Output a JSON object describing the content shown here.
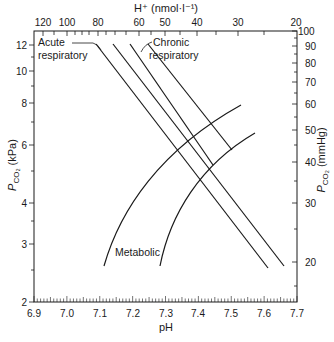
{
  "chart_data": {
    "type": "line",
    "title": "",
    "xlabel": "pH",
    "ylabel": "P_CO2 (kPa)",
    "ylabel_right": "P_CO2 (mmHg)",
    "xlabel_top": "H+ (nmol·l-1)",
    "xlim": [
      6.9,
      7.7
    ],
    "ylim": [
      2,
      13
    ],
    "yscale": "log",
    "grid": false,
    "x_ticks": [
      "6.9",
      "7.0",
      "7.1",
      "7.2",
      "7.3",
      "7.4",
      "7.5",
      "7.6",
      "7.7"
    ],
    "y_ticks_left": [
      "2",
      "3",
      "4",
      "6",
      "8",
      "10",
      "12"
    ],
    "y_ticks_right": [
      "20",
      "30",
      "40",
      "50",
      "60",
      "70",
      "80",
      "90",
      "100"
    ],
    "x_ticks_top": [
      "120",
      "100",
      "80",
      "60",
      "50",
      "40",
      "30",
      "20"
    ],
    "annotations": [
      "Acute respiratory",
      "Chronic respiratory",
      "Metabolic"
    ],
    "series": [
      {
        "name": "Acute respiratory (upper bound)",
        "x": [
          7.09,
          7.62
        ],
        "y": [
          11.9,
          2.7
        ]
      },
      {
        "name": "Acute respiratory (lower bound)",
        "x": [
          7.14,
          7.66
        ],
        "y": [
          11.9,
          2.7
        ]
      },
      {
        "name": "Chronic respiratory (upper bound)",
        "x": [
          7.19,
          7.44
        ],
        "y": [
          11.9,
          5.2
        ]
      },
      {
        "name": "Chronic respiratory (lower bound)",
        "x": [
          7.24,
          7.5
        ],
        "y": [
          11.9,
          5.9
        ]
      },
      {
        "name": "Metabolic (upper bound)",
        "x": [
          7.11,
          7.21,
          7.32,
          7.43,
          7.53
        ],
        "y": [
          2.7,
          3.7,
          4.9,
          6.2,
          8.0
        ]
      },
      {
        "name": "Metabolic (lower bound)",
        "x": [
          7.28,
          7.35,
          7.43,
          7.5,
          7.57
        ],
        "y": [
          2.7,
          3.6,
          4.6,
          5.5,
          6.8
        ]
      }
    ]
  },
  "labels": {
    "top_axis_title": "H⁺ (nmol·l⁻¹)",
    "left_axis_title": "P",
    "left_axis_sub": "CO₂",
    "left_axis_unit": " (kPa)",
    "right_axis_title": "P",
    "right_axis_sub": "CO₂",
    "right_axis_unit": " (mmHg)",
    "bottom_axis_title": "pH",
    "acute_1": "Acute",
    "acute_2": "respiratory",
    "chronic_1": "Chronic",
    "chronic_2": "respiratory",
    "metabolic": "Metabolic"
  },
  "ticks": {
    "bottom": [
      "6.9",
      "7.0",
      "7.1",
      "7.2",
      "7.3",
      "7.4",
      "7.5",
      "7.6",
      "7.7"
    ],
    "top": [
      "120",
      "100",
      "80",
      "60",
      "50",
      "40",
      "30",
      "20"
    ],
    "left": [
      "12",
      "10",
      "8",
      "6",
      "4",
      "3",
      "2"
    ],
    "right": [
      "100",
      "90",
      "80",
      "70",
      "60",
      "50",
      "40",
      "30",
      "20"
    ]
  },
  "colors": {
    "ink": "#1a1a1a",
    "background": "#ffffff"
  }
}
